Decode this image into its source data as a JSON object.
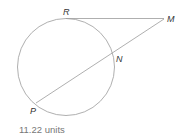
{
  "diagram": {
    "type": "circle-tangent-secant",
    "points": {
      "R": {
        "label": "R"
      },
      "M": {
        "label": "M"
      },
      "N": {
        "label": "N"
      },
      "P": {
        "label": "P"
      }
    },
    "segments": [
      "RM",
      "PM"
    ],
    "colors": {
      "stroke": "#9a9a9a",
      "label": "#333333",
      "caption": "#777777"
    }
  },
  "answer": {
    "text": "11.22 units"
  }
}
